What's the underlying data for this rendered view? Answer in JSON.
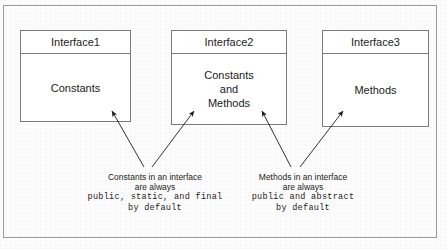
{
  "diagram": {
    "frame_color": "#9a9a9a",
    "box_border_color": "#7a7a7a",
    "text_color": "#1b1b1b",
    "background_color": "#fdfdfd",
    "boxes": [
      {
        "id": "interface1",
        "header": "Interface1",
        "body_lines": [
          "Constants"
        ]
      },
      {
        "id": "interface2",
        "header": "Interface2",
        "body_lines": [
          "Constants",
          "and",
          "Methods"
        ]
      },
      {
        "id": "interface3",
        "header": "Interface3",
        "body_lines": [
          "Methods"
        ]
      }
    ],
    "captions": [
      {
        "id": "constants-note",
        "sans_lines": [
          "Constants in an interface",
          "are always"
        ],
        "mono_lines": [
          "public, static, and final",
          "by default"
        ]
      },
      {
        "id": "methods-note",
        "sans_lines": [
          "Methods in an interface",
          "are always"
        ],
        "mono_lines": [
          "public and abstract",
          "by default"
        ]
      }
    ],
    "arrows": [
      {
        "id": "arrow-constants-to-interface1",
        "from": "constants-note",
        "to": "interface1"
      },
      {
        "id": "arrow-constants-to-interface2",
        "from": "constants-note",
        "to": "interface2"
      },
      {
        "id": "arrow-methods-to-interface2",
        "from": "methods-note",
        "to": "interface2"
      },
      {
        "id": "arrow-methods-to-interface3",
        "from": "methods-note",
        "to": "interface3"
      }
    ]
  }
}
